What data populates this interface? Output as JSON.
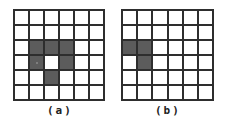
{
  "panels": [
    {
      "id": "a",
      "label": "(a)",
      "rows": 6,
      "cols": 6,
      "filled_cells": [
        [
          2,
          1
        ],
        [
          2,
          2
        ],
        [
          2,
          3
        ],
        [
          3,
          1
        ],
        [
          3,
          3
        ],
        [
          4,
          2
        ]
      ],
      "marked_cell": [
        3,
        1
      ]
    },
    {
      "id": "b",
      "label": "(b)",
      "rows": 6,
      "cols": 6,
      "filled_cells": [
        [
          2,
          0
        ],
        [
          2,
          1
        ],
        [
          3,
          1
        ]
      ]
    }
  ],
  "colors": {
    "filled": "#5c5c5c",
    "empty": "#ffffff",
    "grid_line": "#2e2e2e"
  }
}
